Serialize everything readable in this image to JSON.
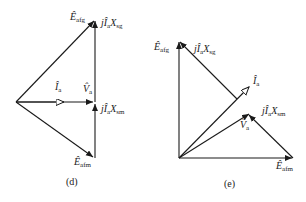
{
  "diagrams": [
    {
      "caption": "(d)",
      "labels": {
        "E_afg": {
          "sym": "Ê",
          "sub": "afg"
        },
        "jIaXsg": {
          "pre": "jÎ",
          "sub1": "a",
          "x": "X",
          "sub2": "sg"
        },
        "Ia": {
          "sym": "Î",
          "sub": "a"
        },
        "Va": {
          "sym": "V̂",
          "sub": "a"
        },
        "jIaXsm": {
          "pre": "jÎ",
          "sub1": "a",
          "x": "X",
          "sub2": "sm"
        },
        "E_afm": {
          "sym": "Ê",
          "sub": "afm"
        }
      }
    },
    {
      "caption": "(e)",
      "labels": {
        "E_afg": {
          "sym": "Ê",
          "sub": "afg"
        },
        "jIaXsg": {
          "pre": "jÎ",
          "sub1": "a",
          "x": "X",
          "sub2": "sg"
        },
        "Ia": {
          "sym": "Î",
          "sub": "a"
        },
        "Va": {
          "sym": "V̂",
          "sub": "a"
        },
        "jIaXsm": {
          "pre": "jÎ",
          "sub1": "a",
          "x": "X",
          "sub2": "sm"
        },
        "E_afm": {
          "sym": "Ê",
          "sub": "afm"
        }
      }
    }
  ],
  "colors": {
    "stroke": "#1a1a1a",
    "background": "#ffffff"
  }
}
